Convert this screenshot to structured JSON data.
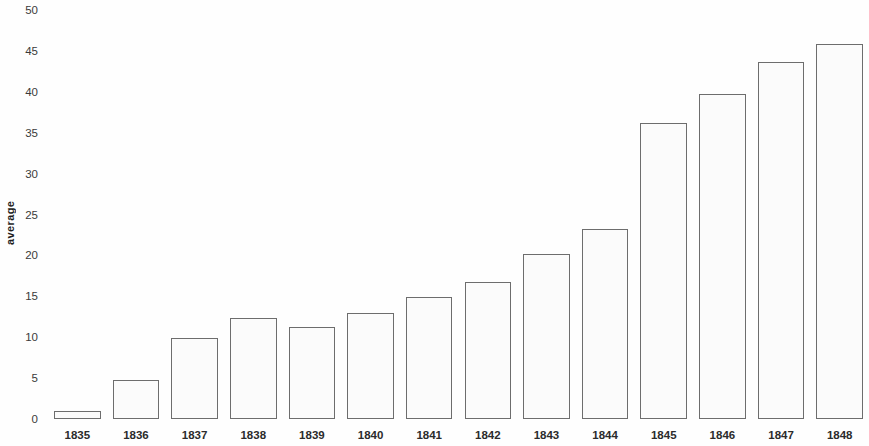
{
  "chart_data": {
    "type": "bar",
    "title": "",
    "subtitle": "",
    "xlabel": "",
    "ylabel": "average",
    "categories": [
      "1835",
      "1836",
      "1837",
      "1838",
      "1839",
      "1840",
      "1841",
      "1842",
      "1843",
      "1844",
      "1845",
      "1846",
      "1847",
      "1848"
    ],
    "values": [
      1.0,
      4.8,
      9.9,
      12.3,
      11.2,
      13.0,
      14.9,
      16.7,
      20.2,
      23.2,
      36.2,
      39.7,
      43.7,
      45.9
    ],
    "ylim": [
      0,
      50
    ],
    "ytick_labels": [
      "0",
      "5",
      "10",
      "15",
      "20",
      "25",
      "30",
      "35",
      "40",
      "45",
      "50"
    ],
    "ytick_values": [
      0,
      5,
      10,
      15,
      20,
      25,
      30,
      35,
      40,
      45,
      50
    ],
    "grid": false,
    "legend": null,
    "legend_position": "none",
    "annotations": [],
    "series": [
      {
        "name": "average",
        "values": [
          1.0,
          4.8,
          9.9,
          12.3,
          11.2,
          13.0,
          14.9,
          16.7,
          20.2,
          23.2,
          36.2,
          39.7,
          43.7,
          45.9
        ]
      }
    ],
    "colors": {
      "bar_fill": "#fbfbfb",
      "bar_stroke": "#6d6d6d",
      "background": "#fefefe",
      "text": "#2b2b2b"
    }
  }
}
